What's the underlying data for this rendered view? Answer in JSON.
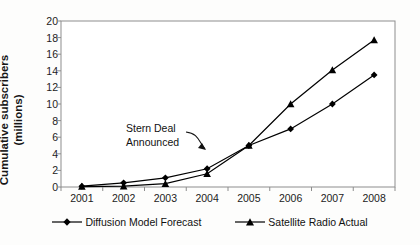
{
  "chart_data": {
    "type": "line",
    "title": "",
    "xlabel": "",
    "ylabel": "Cumulative subscribers (millions)",
    "ylabel_line1": "Cumulative subscribers",
    "ylabel_line2": "(millions)",
    "categories": [
      "2001",
      "2002",
      "2003",
      "2004",
      "2005",
      "2006",
      "2007",
      "2008"
    ],
    "x": [
      2001,
      2002,
      2003,
      2004,
      2005,
      2006,
      2007,
      2008
    ],
    "ylim": [
      0,
      20
    ],
    "ytick_values": [
      0,
      2,
      4,
      6,
      8,
      10,
      12,
      14,
      16,
      18,
      20
    ],
    "ytick_labels": [
      "0",
      "2",
      "4",
      "6",
      "8",
      "10",
      "12",
      "14",
      "16",
      "18",
      "20"
    ],
    "grid": false,
    "legend_position": "bottom",
    "series": [
      {
        "name": "Diffusion Model Forecast",
        "marker": "diamond",
        "color": "#000000",
        "values": [
          0.1,
          0.5,
          1.1,
          2.2,
          5.0,
          7.0,
          10.0,
          13.5
        ]
      },
      {
        "name": "Satellite Radio Actual",
        "marker": "triangle",
        "color": "#000000",
        "values": [
          0.05,
          0.1,
          0.4,
          1.6,
          5.0,
          10.0,
          14.1,
          17.7
        ]
      }
    ],
    "annotations": [
      {
        "text": "Stern Deal Announced",
        "line1": "Stern Deal",
        "line2": "Announced",
        "points_to_year": 2005
      }
    ]
  }
}
